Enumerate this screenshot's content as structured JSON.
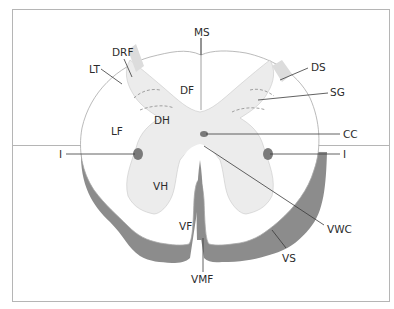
{
  "diagram": {
    "colors": {
      "frame_border": "#b5b5b5",
      "white_matter": "#ffffff",
      "grey_matter": "#ececec",
      "outline": "#a0a0a0",
      "shadow_band": "#8c8c8c",
      "dot": "#7a7a7a",
      "leader": "#3a3a3a",
      "text": "#2b2b2b"
    },
    "labels": {
      "MS": "MS",
      "DRF": "DRF",
      "LT": "LT",
      "DF": "DF",
      "DS": "DS",
      "SG": "SG",
      "DH": "DH",
      "LF": "LF",
      "CC": "CC",
      "I_left": "I",
      "I_right": "I",
      "VH": "VH",
      "VF": "VF",
      "VWC": "VWC",
      "VS": "VS",
      "VMF": "VMF"
    }
  }
}
